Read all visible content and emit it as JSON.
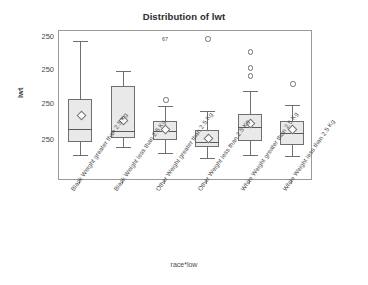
{
  "chart_data": {
    "type": "box",
    "title": "Distribution of lwt",
    "xlabel": "race*low",
    "ylabel": "lwt",
    "grid": false,
    "legend": false,
    "ytick_labels": [
      "250",
      "250",
      "250",
      "250"
    ],
    "categories": [
      "Black Weight greater than 2.5 Kg",
      "Black Weight less than 2.5 Kg",
      "Other Weight greater than 2.5 Kg",
      "Other Weight less than 2.5 Kg",
      "White Weight greater than 2.5 Kg",
      "White Weight less than 2.5 Kg"
    ],
    "boxes": [
      {
        "category": "Black Weight greater than 2.5 Kg",
        "whisker_high_px": 40,
        "q3_px": 98,
        "median_px": 128,
        "q1_px": 141,
        "whisker_low_px": 154,
        "mean_px": 113,
        "outliers_px": []
      },
      {
        "category": "Black Weight less than 2.5 Kg",
        "whisker_high_px": 70,
        "q3_px": 85,
        "median_px": 130,
        "q1_px": 137,
        "whisker_low_px": 146,
        "mean_px": 118,
        "outliers_px": []
      },
      {
        "category": "Other Weight greater than 2.5 Kg",
        "whisker_high_px": 105,
        "q3_px": 120,
        "median_px": 130,
        "q1_px": 139,
        "whisker_low_px": 152,
        "mean_px": 127,
        "outliers_px": [
          98
        ]
      },
      {
        "category": "Other Weight less than 2.5 Kg",
        "whisker_high_px": 110,
        "q3_px": 129,
        "median_px": 141,
        "q1_px": 146,
        "whisker_low_px": 157,
        "mean_px": 136,
        "outliers_px": [
          37
        ]
      },
      {
        "category": "White Weight greater than 2.5 Kg",
        "whisker_high_px": 90,
        "q3_px": 113,
        "median_px": 126,
        "q1_px": 140,
        "whisker_low_px": 154,
        "mean_px": 121,
        "outliers_px": [
          50,
          66,
          74
        ]
      },
      {
        "category": "White Weight less than 2.5 Kg",
        "whisker_high_px": 104,
        "q3_px": 120,
        "median_px": 132,
        "q1_px": 144,
        "whisker_low_px": 155,
        "mean_px": 127,
        "outliers_px": [
          82
        ]
      }
    ],
    "annotations": [
      {
        "text": "67",
        "x_px": 161,
        "y_px": 35
      }
    ]
  }
}
